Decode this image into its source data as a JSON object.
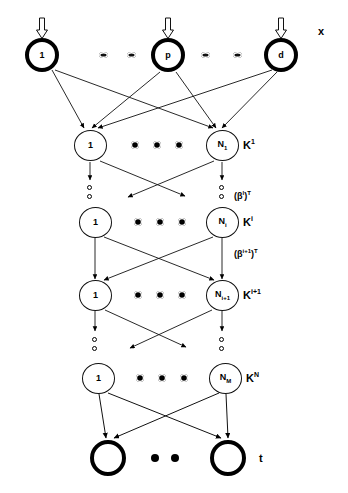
{
  "figure": {
    "type": "neural-network-diagram",
    "title": "",
    "colors": {
      "stroke": "#000000",
      "fill": "#ffffff"
    }
  },
  "layers": [
    {
      "id": "input",
      "label": "x",
      "label_pos": {
        "x": 318,
        "y": 25
      },
      "style": "thick",
      "y": 55,
      "nodes": [
        {
          "label": "1",
          "x": 42
        },
        {
          "label": "p",
          "x": 168
        },
        {
          "label": "d",
          "x": 281
        }
      ],
      "ellipsis_dots": [
        {
          "x": 103,
          "y": 55
        },
        {
          "x": 131,
          "y": 55
        },
        {
          "x": 205,
          "y": 55
        },
        {
          "x": 237,
          "y": 55
        }
      ],
      "has_input_arrows": true
    },
    {
      "id": "K1",
      "label": "K",
      "label_sup": "1",
      "label_pos": {
        "x": 247,
        "y": 138
      },
      "style": "thin",
      "y": 145,
      "nodes": [
        {
          "label": "1",
          "x": 90
        },
        {
          "label": "N",
          "sub": "1",
          "x": 222
        }
      ],
      "ellipsis_dots": [
        {
          "x": 135,
          "y": 145
        },
        {
          "x": 157,
          "y": 145
        },
        {
          "x": 179,
          "y": 145
        }
      ]
    },
    {
      "id": "Ki",
      "label": "K",
      "label_sup": "i",
      "label_pos": {
        "x": 247,
        "y": 215
      },
      "style": "thin",
      "y": 222,
      "nodes": [
        {
          "label": "1",
          "x": 95
        },
        {
          "label": "N",
          "sub": "i",
          "x": 222
        }
      ],
      "ellipsis_dots": [
        {
          "x": 138,
          "y": 222
        },
        {
          "x": 160,
          "y": 222
        },
        {
          "x": 182,
          "y": 222
        }
      ]
    },
    {
      "id": "Ki1",
      "label": "K",
      "label_sup": "i+1",
      "label_pos": {
        "x": 247,
        "y": 288
      },
      "style": "thin",
      "y": 295,
      "nodes": [
        {
          "label": "1",
          "x": 95
        },
        {
          "label": "N",
          "sub": "i+1",
          "x": 222
        }
      ],
      "ellipsis_dots": [
        {
          "x": 138,
          "y": 295
        },
        {
          "x": 160,
          "y": 295
        },
        {
          "x": 182,
          "y": 295
        }
      ]
    },
    {
      "id": "KN",
      "label": "K",
      "label_sup": "N",
      "label_pos": {
        "x": 250,
        "y": 371
      },
      "style": "thin",
      "y": 378,
      "nodes": [
        {
          "label": "1",
          "x": 98
        },
        {
          "label": "N",
          "sub": "M",
          "x": 225
        }
      ],
      "ellipsis_dots": [
        {
          "x": 140,
          "y": 378
        },
        {
          "x": 162,
          "y": 378
        },
        {
          "x": 184,
          "y": 378
        }
      ]
    },
    {
      "id": "output",
      "label": "t",
      "label_pos": {
        "x": 259,
        "y": 452
      },
      "style": "thick",
      "y": 458,
      "nodes": [
        {
          "label": "",
          "x": 108
        },
        {
          "label": "",
          "x": 228
        }
      ],
      "ellipsis_dots": [
        {
          "x": 155,
          "y": 458
        },
        {
          "x": 175,
          "y": 458
        }
      ]
    }
  ],
  "weight_labels": [
    {
      "text": "(β",
      "sup": "l",
      "tail": ")",
      "sup2": "T",
      "x": 238,
      "y": 190,
      "full": "(βl)T"
    },
    {
      "text": "(β",
      "sup": "i+1",
      "tail": ")",
      "sup2": "T",
      "x": 238,
      "y": 252,
      "full": "(βi+1)T"
    }
  ],
  "vertical_ellipses": [
    {
      "x": 90,
      "y": 188
    },
    {
      "x": 222,
      "y": 188
    },
    {
      "x": 95,
      "y": 340
    },
    {
      "x": 222,
      "y": 340
    }
  ],
  "annotations": {
    "input_label": "x",
    "output_label": "t",
    "layer_labels": [
      "K1",
      "Kl",
      "Ki",
      "Ki+1",
      "KN"
    ]
  }
}
